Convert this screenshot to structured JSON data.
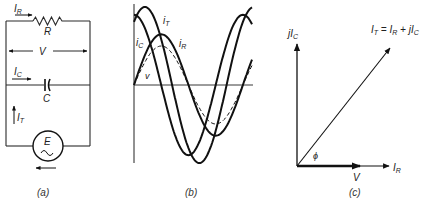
{
  "panels": {
    "a": {
      "caption": "(a)",
      "labels": {
        "resistor_current": "I",
        "resistor_current_sub": "R",
        "resistor": "R",
        "voltage": "V",
        "capacitor_current": "I",
        "capacitor_current_sub": "C",
        "capacitor": "C",
        "total_current": "I",
        "total_current_sub": "T",
        "source": "E"
      }
    },
    "b": {
      "caption": "(b)",
      "labels": {
        "i_T": "i",
        "i_T_sub": "T",
        "i_C": "i",
        "i_C_sub": "C",
        "i_R": "i",
        "i_R_sub": "R",
        "v": "v"
      }
    },
    "c": {
      "caption": "(c)",
      "labels": {
        "jIC": "jI",
        "jIC_sub": "C",
        "IT_eq_a": "I",
        "IT_eq_a_sub": "T",
        "IT_eq_b": " = I",
        "IT_eq_b_sub": "R",
        "IT_eq_c": " + jI",
        "IT_eq_c_sub": "C",
        "IR": "I",
        "IR_sub": "R",
        "V": "V",
        "phi": "ϕ"
      }
    }
  },
  "chart_data": {
    "type": "line",
    "title": "",
    "xlabel": "",
    "ylabel": "",
    "series": [
      {
        "name": "v",
        "style": "dashed",
        "amplitude": 0.5,
        "phase_deg": 0
      },
      {
        "name": "i_R",
        "style": "solid",
        "amplitude": 0.65,
        "phase_deg": 0
      },
      {
        "name": "i_C",
        "style": "solid",
        "amplitude": 0.9,
        "phase_deg": 90
      },
      {
        "name": "i_T",
        "style": "solid",
        "amplitude": 1.0,
        "phase_deg": 54
      }
    ],
    "x_range_deg": [
      0,
      390
    ],
    "ylim": [
      -1.1,
      1.1
    ]
  }
}
